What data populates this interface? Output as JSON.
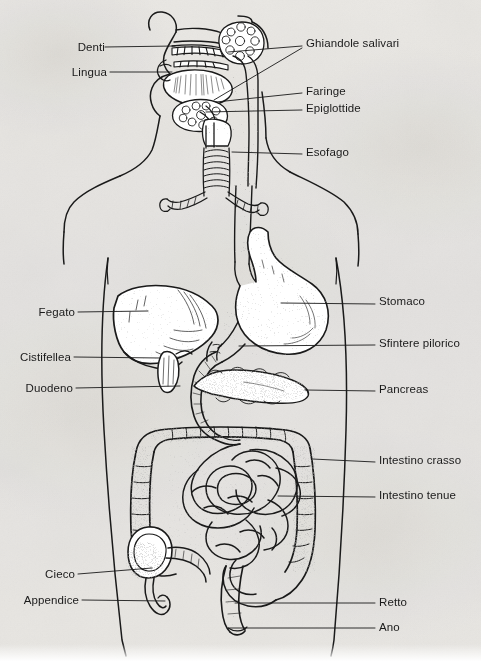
{
  "document": {
    "kind": "scanned-anatomy-diagram",
    "title": "Apparato digerente",
    "language": "Italian",
    "background_color": "#f3f2f0",
    "ink_color": "#1a1a1a"
  },
  "figure": {
    "structures": [
      "nasal cavity",
      "teeth",
      "tongue",
      "salivary glands",
      "pharynx",
      "epiglottis",
      "larynx",
      "trachea",
      "bronchi",
      "esophagus",
      "stomach",
      "liver",
      "gallbladder",
      "pyloric sphincter",
      "duodenum",
      "pancreas",
      "large intestine",
      "small intestine",
      "cecum",
      "appendix",
      "rectum",
      "anus",
      "body outline"
    ]
  },
  "labels": {
    "left": [
      {
        "id": "denti",
        "text": "Denti",
        "x": 75,
        "y": 50,
        "leader_to_x": 175,
        "leader_to_y": 46
      },
      {
        "id": "lingua",
        "text": "Lingua",
        "x": 68,
        "y": 75,
        "leader_to_x": 172,
        "leader_to_y": 72
      },
      {
        "id": "fegato",
        "text": "Fegato",
        "x": 33,
        "y": 315,
        "leader_to_x": 148,
        "leader_to_y": 311
      },
      {
        "id": "cistifellea",
        "text": "Cistifellea",
        "x": 20,
        "y": 360,
        "leader_to_x": 160,
        "leader_to_y": 358
      },
      {
        "id": "duodeno",
        "text": "Duodeno",
        "x": 22,
        "y": 391,
        "leader_to_x": 180,
        "leader_to_y": 386
      },
      {
        "id": "cieco",
        "text": "Cieco",
        "x": 45,
        "y": 577,
        "leader_to_x": 152,
        "leader_to_y": 568
      },
      {
        "id": "appendice",
        "text": "Appendice",
        "x": 20,
        "y": 603,
        "leader_to_x": 165,
        "leader_to_y": 601
      }
    ],
    "right": [
      {
        "id": "ghiandole-salivari",
        "text": "Ghiandole salivari",
        "x": 306,
        "y": 44,
        "leader_to_x": 228,
        "leader_to_y": 52
      },
      {
        "id": "faringe",
        "text": "Faringe",
        "x": 306,
        "y": 91,
        "leader_to_x": 216,
        "leader_to_y": 102
      },
      {
        "id": "epiglottide",
        "text": "Epiglottide",
        "x": 306,
        "y": 108,
        "leader_to_x": 206,
        "leader_to_y": 112
      },
      {
        "id": "esofago",
        "text": "Esofago",
        "x": 306,
        "y": 153,
        "leader_to_x": 232,
        "leader_to_y": 152
      },
      {
        "id": "stomaco",
        "text": "Stomaco",
        "x": 379,
        "y": 303,
        "leader_to_x": 281,
        "leader_to_y": 303
      },
      {
        "id": "sfintere-pilorico",
        "text": "Sfintere pilorico",
        "x": 379,
        "y": 343,
        "leader_to_x": 239,
        "leader_to_y": 346
      },
      {
        "id": "pancreas",
        "text": "Pancreas",
        "x": 379,
        "y": 390,
        "leader_to_x": 305,
        "leader_to_y": 390
      },
      {
        "id": "intestino-crasso",
        "text": "Intestino crasso",
        "x": 379,
        "y": 462,
        "leader_to_x": 312,
        "leader_to_y": 459
      },
      {
        "id": "intestino-tenue",
        "text": "Intestino tenue",
        "x": 379,
        "y": 496,
        "leader_to_x": 278,
        "leader_to_y": 496
      },
      {
        "id": "retto",
        "text": "Retto",
        "x": 379,
        "y": 603,
        "leader_to_x": 235,
        "leader_to_y": 603
      },
      {
        "id": "ano",
        "text": "Ano",
        "x": 379,
        "y": 628,
        "leader_to_x": 228,
        "leader_to_y": 628
      }
    ]
  }
}
